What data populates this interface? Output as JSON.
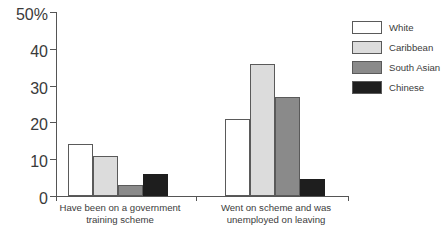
{
  "chart_data": {
    "type": "bar",
    "title": "",
    "subtitle": "",
    "xlabel": "",
    "ylabel": "",
    "ylim": [
      0,
      50
    ],
    "yticks": [
      0,
      10,
      20,
      30,
      40,
      50
    ],
    "ytick_labels": [
      "0",
      "10",
      "20",
      "30",
      "40",
      "50%"
    ],
    "grid": false,
    "legend_position": "right",
    "categories": [
      "Have been on a government\ntraining scheme",
      "Went on scheme and was\nunemployed on leaving"
    ],
    "series": [
      {
        "name": "White",
        "color": "#ffffff",
        "values": [
          14,
          21
        ]
      },
      {
        "name": "Caribbean",
        "color": "#dcdcdc",
        "values": [
          11,
          36
        ]
      },
      {
        "name": "South Asian",
        "color": "#8a8a8a",
        "values": [
          3,
          27
        ]
      },
      {
        "name": "Chinese",
        "color": "#1e1e1e",
        "values": [
          6,
          4.5
        ]
      }
    ]
  },
  "legend": {
    "items": [
      {
        "label": "White"
      },
      {
        "label": "Caribbean"
      },
      {
        "label": "South Asian"
      },
      {
        "label": "Chinese"
      }
    ]
  },
  "axis": {
    "y_labels": [
      "50%",
      "40",
      "30",
      "20",
      "10",
      "0"
    ]
  }
}
